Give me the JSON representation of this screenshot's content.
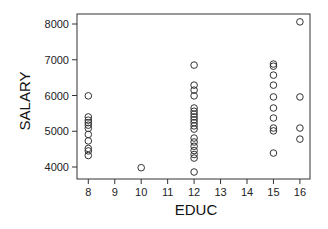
{
  "chart_data": {
    "type": "scatter",
    "title": "",
    "xlabel": "EDUC",
    "ylabel": "SALARY",
    "xlim": [
      7.6,
      16.4
    ],
    "ylim": [
      3750,
      8250
    ],
    "xticks": [
      8,
      9,
      10,
      11,
      12,
      13,
      14,
      15,
      16
    ],
    "yticks": [
      4000,
      5000,
      6000,
      7000,
      8000
    ],
    "grid": false,
    "legend": null,
    "marker": "open-circle",
    "series": [
      {
        "name": "SALARY vs EDUC",
        "points": [
          {
            "x": 8,
            "y": 5990
          },
          {
            "x": 8,
            "y": 5400
          },
          {
            "x": 8,
            "y": 5310
          },
          {
            "x": 8,
            "y": 5240
          },
          {
            "x": 8,
            "y": 5170
          },
          {
            "x": 8,
            "y": 5080
          },
          {
            "x": 8,
            "y": 4910
          },
          {
            "x": 8,
            "y": 4730
          },
          {
            "x": 8,
            "y": 4520
          },
          {
            "x": 8,
            "y": 4450
          },
          {
            "x": 8,
            "y": 4320
          },
          {
            "x": 10,
            "y": 3980
          },
          {
            "x": 12,
            "y": 6850
          },
          {
            "x": 12,
            "y": 6290
          },
          {
            "x": 12,
            "y": 6150
          },
          {
            "x": 12,
            "y": 5990
          },
          {
            "x": 12,
            "y": 5650
          },
          {
            "x": 12,
            "y": 5560
          },
          {
            "x": 12,
            "y": 5480
          },
          {
            "x": 12,
            "y": 5400
          },
          {
            "x": 12,
            "y": 5320
          },
          {
            "x": 12,
            "y": 5240
          },
          {
            "x": 12,
            "y": 5150
          },
          {
            "x": 12,
            "y": 5060
          },
          {
            "x": 12,
            "y": 4810
          },
          {
            "x": 12,
            "y": 4700
          },
          {
            "x": 12,
            "y": 4580
          },
          {
            "x": 12,
            "y": 4460
          },
          {
            "x": 12,
            "y": 4350
          },
          {
            "x": 12,
            "y": 4250
          },
          {
            "x": 12,
            "y": 3860
          },
          {
            "x": 15,
            "y": 6880
          },
          {
            "x": 15,
            "y": 6820
          },
          {
            "x": 15,
            "y": 6570
          },
          {
            "x": 15,
            "y": 6290
          },
          {
            "x": 15,
            "y": 5960
          },
          {
            "x": 15,
            "y": 5650
          },
          {
            "x": 15,
            "y": 5370
          },
          {
            "x": 15,
            "y": 5090
          },
          {
            "x": 15,
            "y": 5010
          },
          {
            "x": 15,
            "y": 4390
          },
          {
            "x": 16,
            "y": 8060
          },
          {
            "x": 16,
            "y": 5960
          },
          {
            "x": 16,
            "y": 5090
          },
          {
            "x": 16,
            "y": 4780
          }
        ]
      }
    ],
    "colors": {
      "marker": "#333333",
      "axis": "#333333",
      "background": "#ffffff"
    }
  },
  "labels": {
    "x_axis": "EDUC",
    "y_axis": "SALARY"
  }
}
